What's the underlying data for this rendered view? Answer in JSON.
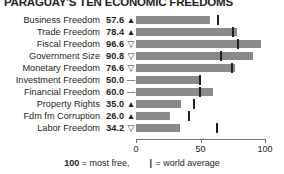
{
  "title": "PARAGUAY'S TEN ECONOMIC FREEDOMS",
  "chart_data": {
    "type": "bar",
    "title": "PARAGUAY'S TEN ECONOMIC FREEDOMS",
    "xlabel": "",
    "ylabel": "",
    "xlim": [
      0,
      100
    ],
    "grid": false,
    "orientation": "horizontal",
    "bar_color": "#8a8a8a",
    "marker_color": "#231f20",
    "categories": [
      "Business Freedom",
      "Trade Freedom",
      "Fiscal Freedom",
      "Government Size",
      "Monetary Freedom",
      "Investment Freedom",
      "Financial Freedom",
      "Property Rights",
      "Fdm fm Corruption",
      "Labor Freedom"
    ],
    "values": [
      57.6,
      78.4,
      96.6,
      90.8,
      76.6,
      50.0,
      60.0,
      35.0,
      26.0,
      34.2
    ],
    "trends": [
      "up",
      "up",
      "down",
      "down",
      "down",
      "flat",
      "flat",
      "up",
      "up",
      "down"
    ],
    "world_average": [
      63.0,
      74.5,
      78.0,
      65.0,
      73.5,
      49.0,
      49.0,
      44.0,
      40.0,
      62.0
    ],
    "axis_ticks": [
      0,
      50,
      100
    ],
    "axis_tick_labels": [
      "0",
      "50",
      "100"
    ]
  },
  "rows": [
    {
      "label": "Business Freedom",
      "value": "57.6",
      "glyph": "▲",
      "bar": 57.6,
      "avg": 63.0
    },
    {
      "label": "Trade Freedom",
      "value": "78.4",
      "glyph": "▲",
      "bar": 78.4,
      "avg": 74.5
    },
    {
      "label": "Fiscal Freedom",
      "value": "96.6",
      "glyph": "▽",
      "bar": 96.6,
      "avg": 78.0
    },
    {
      "label": "Government Size",
      "value": "90.8",
      "glyph": "▽",
      "bar": 90.8,
      "avg": 65.0
    },
    {
      "label": "Monetary Freedom",
      "value": "76.6",
      "glyph": "▽",
      "bar": 76.6,
      "avg": 73.5
    },
    {
      "label": "Investment Freedom",
      "value": "50.0",
      "glyph": "—",
      "bar": 50.0,
      "avg": 49.0
    },
    {
      "label": "Financial Freedom",
      "value": "60.0",
      "glyph": "—",
      "bar": 60.0,
      "avg": 49.0
    },
    {
      "label": "Property Rights",
      "value": "35.0",
      "glyph": "▲",
      "bar": 35.0,
      "avg": 44.0
    },
    {
      "label": "Fdm fm Corruption",
      "value": "26.0",
      "glyph": "▲",
      "bar": 26.0,
      "avg": 40.0
    },
    {
      "label": "Labor Freedom",
      "value": "34.2",
      "glyph": "▽",
      "bar": 34.2,
      "avg": 62.0
    }
  ],
  "axis": {
    "labels": [
      "0",
      "50",
      "100"
    ],
    "positions": [
      0,
      50,
      100
    ]
  },
  "legend": {
    "most_free_value": "100",
    "most_free_text": "= most free,",
    "average_glyph": "|",
    "average_text": "= world average"
  }
}
